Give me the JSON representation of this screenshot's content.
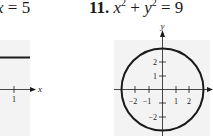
{
  "left_exercise": {
    "equation_var": "x",
    "equation_op": " = ",
    "equation_val": "5",
    "graph": {
      "x_axis_label": "x",
      "x_ticks": [
        "1"
      ],
      "panel_color": "#f3f3f3"
    }
  },
  "right_exercise": {
    "number": "11.",
    "equation": {
      "x": "x",
      "x_exp": "2",
      "plus": " + ",
      "y": "y",
      "y_exp": "2",
      "equals": " = 9"
    },
    "graph": {
      "x_axis_label": "x",
      "y_axis_label": "y",
      "x_ticks": [
        "−2",
        "−1",
        "1",
        "2"
      ],
      "y_ticks": [
        "2",
        "1",
        "−2"
      ],
      "radius": 3,
      "panel_color": "#f3f3f3",
      "curve_color": "#1a1a1a"
    }
  }
}
